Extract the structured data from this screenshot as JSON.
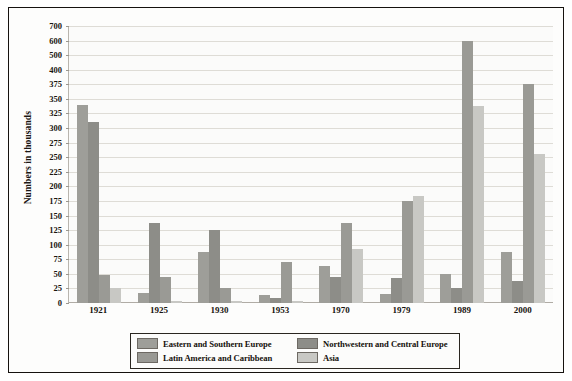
{
  "chart_data": {
    "type": "bar",
    "title": "",
    "xlabel": "",
    "ylabel": "Numbers in thousands",
    "categories": [
      "1921",
      "1925",
      "1930",
      "1953",
      "1970",
      "1979",
      "1989",
      "2000"
    ],
    "yticks": [
      0,
      25,
      50,
      75,
      100,
      125,
      150,
      175,
      200,
      225,
      250,
      275,
      300,
      325,
      350,
      375,
      400,
      500,
      600,
      700
    ],
    "ylim": [
      0,
      700
    ],
    "grid": true,
    "legend_position": "bottom",
    "note": "Y axis uses non-linear spacing: equal increments of 25 from 0 to 400, then 400/500/600/700 at equal spacing.",
    "series": [
      {
        "name": "Eastern and Southern Europe",
        "color": "#9e9e99",
        "values": [
          340,
          18,
          88,
          13,
          63,
          15,
          50,
          88
        ]
      },
      {
        "name": "Northwestern and Central Europe",
        "color": "#8d8d88",
        "values": [
          310,
          137,
          125,
          8,
          45,
          43,
          25,
          38
        ]
      },
      {
        "name": "Latin America and Caribbean",
        "color": "#9a9a95",
        "values": [
          48,
          45,
          25,
          70,
          138,
          175,
          600,
          375
        ]
      },
      {
        "name": "Asia",
        "color": "#c8c8c4",
        "values": [
          25,
          3,
          3,
          3,
          93,
          183,
          338,
          255
        ]
      }
    ]
  },
  "legend": {
    "items": [
      {
        "label": "Eastern and Southern Europe",
        "color": "#9e9e99"
      },
      {
        "label": "Northwestern and Central Europe",
        "color": "#8d8d88"
      },
      {
        "label": "Latin America and Caribbean",
        "color": "#9a9a95"
      },
      {
        "label": "Asia",
        "color": "#c8c8c4"
      }
    ]
  }
}
